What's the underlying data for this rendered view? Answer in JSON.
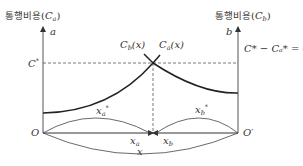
{
  "left_axis": {
    "title_kr": "통행비용",
    "title_var": "C",
    "title_sub": "a",
    "top_label": "a",
    "level_label": "C",
    "level_sup": "*",
    "origin_label": "O"
  },
  "right_axis": {
    "title_kr": "통행비용",
    "title_var": "C",
    "title_sub": "b",
    "top_label": "b",
    "equation": "C* − Cₐ* = C",
    "origin_label": "O′"
  },
  "curves": {
    "cb_label": "C",
    "cb_sub": "b",
    "cb_arg": "(x)",
    "ca_label": "C",
    "ca_sub": "a",
    "ca_arg": "(x)"
  },
  "arcs": {
    "xa_star": "x",
    "xa_star_sub": "a",
    "xb_star": "x",
    "xb_star_sub": "b",
    "xa": "x",
    "xa_sub": "a",
    "xb": "x",
    "xb_sub": "b",
    "x_total": "x"
  },
  "colors": {
    "line": "#333333",
    "dash": "#555555"
  }
}
